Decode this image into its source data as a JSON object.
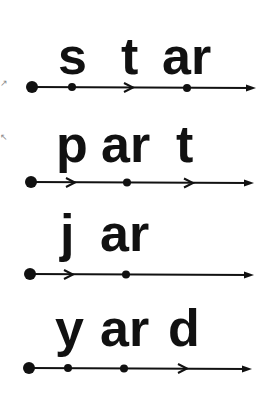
{
  "page": {
    "rows": [
      {
        "segments": [
          "s",
          "t",
          "ar"
        ],
        "word": "star"
      },
      {
        "segments": [
          "p",
          "ar",
          "t"
        ],
        "word": "part"
      },
      {
        "segments": [
          "j",
          "ar"
        ],
        "word": "jar"
      },
      {
        "segments": [
          "y",
          "ar",
          "d"
        ],
        "word": "yard"
      }
    ],
    "edge_marks": [
      "↗",
      "↖"
    ],
    "colors": {
      "ink": "#111111",
      "background": "#ffffff"
    }
  }
}
